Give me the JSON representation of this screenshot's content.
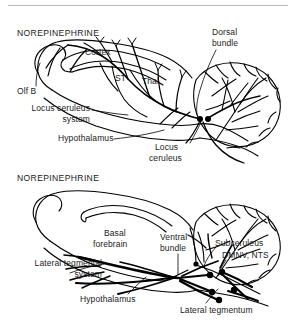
{
  "figure": {
    "name": "norepinephrine-pathways-diagram",
    "stroke_color": "#000000",
    "background_color": "#ffffff",
    "rule_color": "#b9b9b9"
  },
  "panels": [
    {
      "id": "locus-ceruleus-panel",
      "title": "NOREPINEPHRINE",
      "labels": [
        {
          "key": "cortex",
          "text": "Cortex"
        },
        {
          "key": "olf_b",
          "text": "Olf B"
        },
        {
          "key": "st",
          "text": "ST"
        },
        {
          "key": "thal",
          "text": "Thal"
        },
        {
          "key": "dorsal_bundle",
          "text": "Dorsal\nbundle"
        },
        {
          "key": "locus_ceruleus_system",
          "text": "Locus ceruleus\nsystem"
        },
        {
          "key": "hypothalamus",
          "text": "Hypothalamus"
        },
        {
          "key": "locus_ceruleus",
          "text": "Locus\nceruleus"
        }
      ]
    },
    {
      "id": "lateral-tegmental-panel",
      "title": "NOREPINEPHRINE",
      "labels": [
        {
          "key": "basal_forebrain",
          "text": "Basal\nforebrain"
        },
        {
          "key": "ventral_bundle",
          "text": "Ventral\nbundle"
        },
        {
          "key": "subceruleus",
          "text": "Subceruleus"
        },
        {
          "key": "dmnv_nts",
          "text": "DMNV, NTS"
        },
        {
          "key": "lateral_tegmental_system",
          "text": "Lateral tegmental\nsystem"
        },
        {
          "key": "hypothalamus",
          "text": "Hypothalamus"
        },
        {
          "key": "lateral_tegmentum",
          "text": "Lateral tegmentum"
        }
      ]
    }
  ],
  "top": {
    "title": "NOREPINEPHRINE",
    "cortex": "Cortex",
    "olf_b": "Olf B",
    "st": "ST",
    "thal": "Thal",
    "dorsal_bundle_l1": "Dorsal",
    "dorsal_bundle_l2": "bundle",
    "lc_system_l1": "Locus ceruleus",
    "lc_system_l2": "system",
    "hypothalamus": "Hypothalamus",
    "locus_ceruleus_l1": "Locus",
    "locus_ceruleus_l2": "ceruleus"
  },
  "bottom": {
    "title": "NOREPINEPHRINE",
    "basal_forebrain_l1": "Basal",
    "basal_forebrain_l2": "forebrain",
    "ventral_bundle_l1": "Ventral",
    "ventral_bundle_l2": "bundle",
    "subceruleus": "Subceruleus",
    "dmnv_nts": "DMNV, NTS",
    "lts_l1": "Lateral tegmental",
    "lts_l2": "system",
    "hypothalamus": "Hypothalamus",
    "lateral_tegmentum": "Lateral tegmentum"
  }
}
